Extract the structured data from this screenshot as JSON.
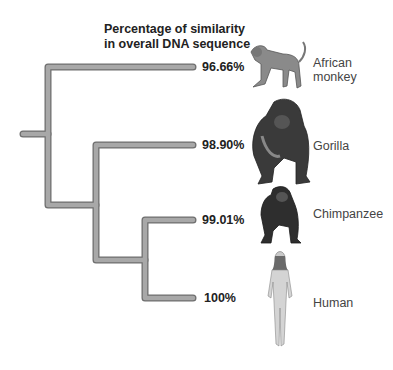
{
  "title_line1": "Percentage of similarity",
  "title_line2": "in overall DNA sequence",
  "branch_color": "#9a9a9a",
  "species": [
    {
      "name": "African monkey",
      "name_line1": "African",
      "name_line2": "monkey",
      "percentage": "96.66%",
      "icon": "monkey-icon"
    },
    {
      "name": "Gorilla",
      "percentage": "98.90%",
      "icon": "gorilla-icon"
    },
    {
      "name": "Chimpanzee",
      "percentage": "99.01%",
      "icon": "chimpanzee-icon"
    },
    {
      "name": "Human",
      "percentage": "100%",
      "icon": "human-icon"
    }
  ]
}
